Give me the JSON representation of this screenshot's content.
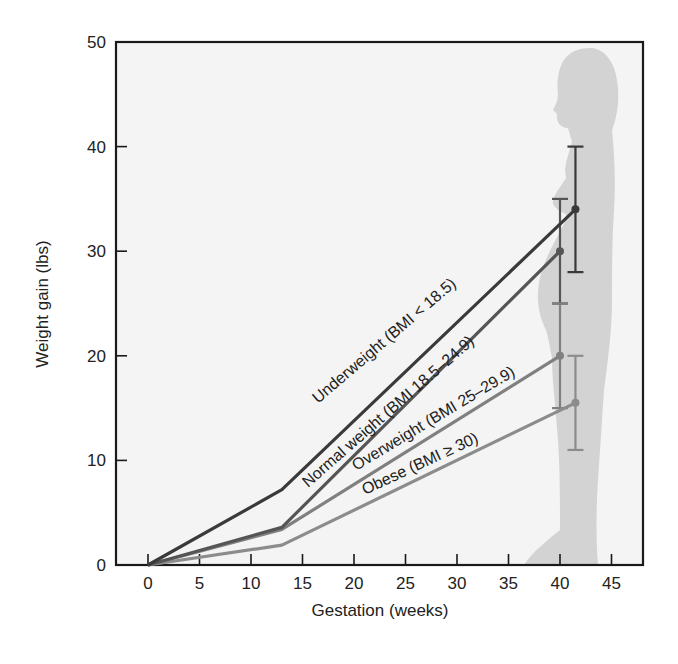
{
  "chart_data": {
    "type": "line",
    "title": "",
    "xlabel": "Gestation (weeks)",
    "ylabel": "Weight gain (lbs)",
    "xlim": [
      -3,
      48
    ],
    "ylim": [
      0,
      50
    ],
    "xticks": [
      0,
      5,
      10,
      15,
      20,
      25,
      30,
      35,
      40,
      45
    ],
    "yticks": [
      0,
      10,
      20,
      30,
      40,
      50
    ],
    "grid": false,
    "legend": "inline labels along lines",
    "background_figure": "pregnant woman silhouette (decorative)",
    "series": [
      {
        "name": "Underweight (BMI < 18.5)",
        "color": "#3a3a3a",
        "x": [
          0,
          13,
          41.5
        ],
        "y": [
          0,
          7.2,
          34
        ],
        "error_bar": {
          "x": 41.5,
          "low": 28,
          "high": 40
        }
      },
      {
        "name": "Normal weight (BMI 18.5–24.9)",
        "color": "#555555",
        "x": [
          0,
          13,
          40
        ],
        "y": [
          0,
          3.6,
          30
        ],
        "error_bar": {
          "x": 40,
          "low": 25,
          "high": 35
        }
      },
      {
        "name": "Overweight (BMI 25–29.9)",
        "color": "#808080",
        "x": [
          0,
          13,
          40
        ],
        "y": [
          0,
          3.4,
          20
        ],
        "error_bar": {
          "x": 40,
          "low": 15,
          "high": 25
        }
      },
      {
        "name": "Obese (BMI ≥ 30)",
        "color": "#8c8c8c",
        "x": [
          0,
          13,
          41.5
        ],
        "y": [
          0,
          1.9,
          15.5
        ],
        "error_bar": {
          "x": 41.5,
          "low": 11,
          "high": 20
        }
      }
    ]
  },
  "labels": {
    "xlabel": "Gestation (weeks)",
    "ylabel": "Weight gain (lbs)",
    "x_ticks": [
      "0",
      "5",
      "10",
      "15",
      "20",
      "25",
      "30",
      "35",
      "40",
      "45"
    ],
    "y_ticks": [
      "0",
      "10",
      "20",
      "30",
      "40",
      "50"
    ],
    "series": [
      "Underweight (BMI < 18.5)",
      "Normal weight (BMI 18.5–24.9)",
      "Overweight (BMI 25–29.9)",
      "Obese (BMI ≥ 30)"
    ]
  },
  "colors": {
    "frame": "#1a1a1a",
    "plot_bg": "#f4f4f4",
    "silhouette": "#d2d2d2"
  }
}
